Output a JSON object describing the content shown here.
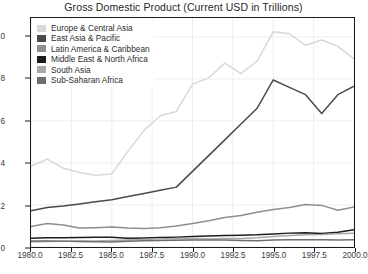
{
  "chart_data": {
    "type": "line",
    "title": "Gross Domestic Product (Current USD in Trillions)",
    "xlabel": "",
    "ylabel": "",
    "xlim": [
      1980,
      2000
    ],
    "ylim": [
      0,
      10.9
    ],
    "grid": true,
    "legend_position": "top-left-inside",
    "xticks": [
      "1980.0",
      "1982.5",
      "1985.0",
      "1987.5",
      "1990.0",
      "1992.5",
      "1995.0",
      "1997.5",
      "2000.0"
    ],
    "xtick_values": [
      1980,
      1982.5,
      1985,
      1987.5,
      1990,
      1992.5,
      1995,
      1997.5,
      2000
    ],
    "yticks": [
      "0",
      "2",
      "4",
      "6",
      "8",
      "10"
    ],
    "ytick_values": [
      0,
      2,
      4,
      6,
      8,
      10
    ],
    "x": [
      1980,
      1981,
      1982,
      1983,
      1984,
      1985,
      1986,
      1987,
      1988,
      1989,
      1990,
      1991,
      1992,
      1993,
      1994,
      1995,
      1996,
      1997,
      1998,
      1999,
      2000
    ],
    "series": [
      {
        "name": "Europe & Central Asia",
        "color": "#d8d8d8",
        "values": [
          3.85,
          4.18,
          3.75,
          3.55,
          3.42,
          3.48,
          4.55,
          5.55,
          6.25,
          6.45,
          7.75,
          8.05,
          8.75,
          8.25,
          8.85,
          10.25,
          10.15,
          9.6,
          9.85,
          9.55,
          8.95
        ]
      },
      {
        "name": "East Asia & Pacific",
        "color": "#4a4a4a",
        "values": [
          1.72,
          1.88,
          1.95,
          2.05,
          2.15,
          2.25,
          2.4,
          2.55,
          2.7,
          2.85,
          3.6,
          4.35,
          5.1,
          5.85,
          6.6,
          7.95,
          7.6,
          7.25,
          6.35,
          7.25,
          7.65
        ]
      },
      {
        "name": "Latin America & Caribbean",
        "color": "#8e8e8e",
        "values": [
          0.98,
          1.12,
          1.05,
          0.9,
          0.92,
          0.95,
          0.9,
          0.88,
          0.92,
          1.0,
          1.12,
          1.25,
          1.4,
          1.5,
          1.65,
          1.78,
          1.88,
          2.02,
          1.98,
          1.75,
          1.9
        ]
      },
      {
        "name": "Middle East & North Africa",
        "color": "#1c1c1c",
        "values": [
          0.42,
          0.44,
          0.44,
          0.45,
          0.46,
          0.46,
          0.42,
          0.43,
          0.45,
          0.47,
          0.5,
          0.52,
          0.55,
          0.56,
          0.58,
          0.62,
          0.66,
          0.68,
          0.64,
          0.7,
          0.82
        ]
      },
      {
        "name": "South Asia",
        "color": "#a8a8a8",
        "values": [
          0.24,
          0.26,
          0.27,
          0.29,
          0.29,
          0.31,
          0.33,
          0.36,
          0.39,
          0.39,
          0.41,
          0.38,
          0.4,
          0.4,
          0.44,
          0.5,
          0.55,
          0.58,
          0.59,
          0.63,
          0.66
        ]
      },
      {
        "name": "Sub-Saharan Africa",
        "color": "#6e6e6e",
        "values": [
          0.29,
          0.29,
          0.28,
          0.26,
          0.25,
          0.24,
          0.27,
          0.3,
          0.31,
          0.32,
          0.33,
          0.33,
          0.33,
          0.31,
          0.3,
          0.33,
          0.34,
          0.35,
          0.34,
          0.33,
          0.34
        ]
      }
    ]
  }
}
